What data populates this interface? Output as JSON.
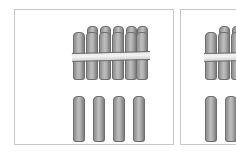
{
  "scene": {
    "title": "Bundled sticks place-value illustration",
    "background_color": "#ffffff",
    "width": 236,
    "height": 159
  },
  "style": {
    "panel_border_color": "#c9c9c9",
    "stick_outline_color": "#6e6e6e",
    "stick_fill_light": "#bdbdbd",
    "stick_fill_dark": "#8f8f8f",
    "band_color": "#f4f4f4"
  },
  "panels": [
    {
      "id": "panel-left",
      "label": "Left panel",
      "groups": [
        {
          "id": "bundle-of-ten",
          "label": "Bundle of ten sticks",
          "count": 10,
          "rows": 2,
          "front_row_count": 6,
          "back_row_count": 4,
          "banded": true,
          "band_label": "rubber band"
        },
        {
          "id": "loose-sticks",
          "label": "Loose single sticks",
          "count": 4,
          "banded": false
        }
      ],
      "represented_number": 14
    },
    {
      "id": "panel-right",
      "label": "Right panel (cut off at image edge)",
      "clipped": true,
      "groups": [
        {
          "id": "bundle-of-ten-right",
          "label": "Bundle of ten sticks",
          "count": 10,
          "rows": 2,
          "front_row_count": 6,
          "back_row_count": 4,
          "banded": true,
          "band_label": "rubber band",
          "visible_portion": "leftmost stick only"
        },
        {
          "id": "loose-sticks-right",
          "label": "Loose single sticks",
          "count": 4,
          "banded": false,
          "visible_portion": "leftmost stick only"
        }
      ]
    }
  ]
}
